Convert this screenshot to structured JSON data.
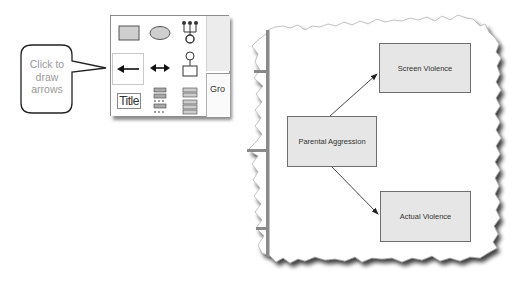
{
  "callout": {
    "text": "Click to draw arrows"
  },
  "palette": {
    "tools": [
      {
        "name": "rectangle-shape-tool",
        "row": 0,
        "col": 0
      },
      {
        "name": "ellipse-shape-tool",
        "row": 0,
        "col": 1
      },
      {
        "name": "hierarchy-tree-tool",
        "row": 0,
        "col": 2
      },
      {
        "name": "single-arrow-tool",
        "row": 1,
        "col": 0,
        "selected": true
      },
      {
        "name": "double-arrow-tool",
        "row": 1,
        "col": 1
      },
      {
        "name": "connector-node-tool",
        "row": 1,
        "col": 2
      },
      {
        "name": "title-text-tool",
        "label": "Title",
        "row": 2,
        "col": 0
      },
      {
        "name": "stacked-list-tool",
        "row": 2,
        "col": 1
      },
      {
        "name": "table-list-tool",
        "row": 2,
        "col": 2
      }
    ],
    "group_label": "Gro"
  },
  "diagram": {
    "nodes": {
      "screen_violence": "Screen Violence",
      "parental_aggression": "Parental Aggression",
      "actual_violence": "Actual Violence"
    },
    "edges": [
      {
        "from": "Parental Aggression",
        "to": "Screen Violence"
      },
      {
        "from": "Parental Aggression",
        "to": "Actual Violence"
      }
    ]
  },
  "colors": {
    "node_fill": "#e6e6e6",
    "node_border": "#6e6e6e",
    "callout_text": "#9a9a9a",
    "sidebar_bar": "#8a8a8a"
  }
}
